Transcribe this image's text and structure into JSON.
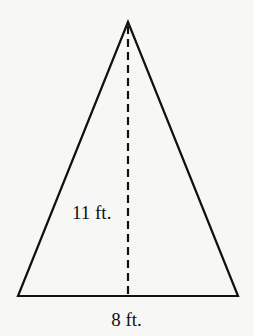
{
  "diagram": {
    "shape": "isosceles-triangle",
    "apex": [
      128,
      22
    ],
    "base_left": [
      18,
      296
    ],
    "base_right": [
      238,
      296
    ],
    "height_line": {
      "from": [
        128,
        26
      ],
      "to": [
        128,
        296
      ],
      "style": "dashed"
    },
    "stroke_color": "#111111",
    "background_color": "#f7f7f5",
    "labels": {
      "height": "11 ft.",
      "base": "8 ft."
    }
  }
}
